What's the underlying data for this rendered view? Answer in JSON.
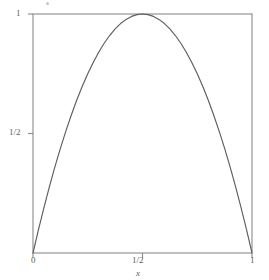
{
  "figure": {
    "name": "parabola-plot",
    "background_color": "#ffffff",
    "line_color": "#5d5d5d",
    "frame_color": "#8a8a8a"
  },
  "labels": {
    "y_tick_1": "1",
    "y_tick_half": "1/2",
    "x_tick_0": "0",
    "x_tick_half": "1/2",
    "x_tick_1": "1",
    "x_axis_name": "x"
  },
  "chart_data": {
    "type": "line",
    "title": "",
    "xlabel": "x",
    "ylabel": "",
    "xlim": [
      0,
      1
    ],
    "ylim": [
      0,
      1
    ],
    "grid": false,
    "legend": false,
    "xticks": [
      0,
      0.5,
      1
    ],
    "xticklabels": [
      "0",
      "1/2",
      "1"
    ],
    "yticks": [
      0.5,
      1
    ],
    "yticklabels": [
      "1/2",
      "1"
    ],
    "frame": "box",
    "series": [
      {
        "name": "4x(1-x)",
        "x": [
          0.0,
          0.025,
          0.05,
          0.075,
          0.1,
          0.125,
          0.15,
          0.175,
          0.2,
          0.225,
          0.25,
          0.275,
          0.3,
          0.325,
          0.35,
          0.375,
          0.4,
          0.425,
          0.45,
          0.475,
          0.5,
          0.525,
          0.55,
          0.575,
          0.6,
          0.625,
          0.65,
          0.675,
          0.7,
          0.725,
          0.75,
          0.775,
          0.8,
          0.825,
          0.85,
          0.875,
          0.9,
          0.925,
          0.95,
          0.975,
          1.0
        ],
        "y": [
          0.0,
          0.0975,
          0.19,
          0.2775,
          0.36,
          0.4375,
          0.51,
          0.5775,
          0.64,
          0.6975,
          0.75,
          0.7975,
          0.84,
          0.8775,
          0.91,
          0.9375,
          0.96,
          0.9775,
          0.99,
          0.9975,
          1.0,
          0.9975,
          0.99,
          0.9775,
          0.96,
          0.9375,
          0.91,
          0.8775,
          0.84,
          0.7975,
          0.75,
          0.6975,
          0.64,
          0.5775,
          0.51,
          0.4375,
          0.36,
          0.2775,
          0.19,
          0.0975,
          0.0
        ]
      }
    ]
  }
}
